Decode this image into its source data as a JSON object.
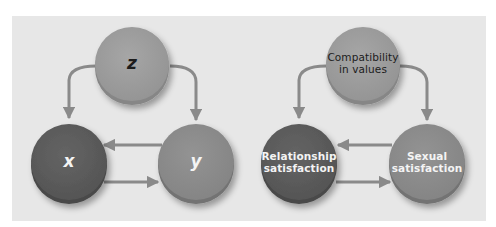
{
  "colors": {
    "background": "#ffffff",
    "panel": "#e7e7e7",
    "top_node": "#9d9d9d",
    "top_node_rim": "#868686",
    "left_node": "#5c5c5c",
    "left_node_rim": "#494949",
    "right_node": "#8c8c8c",
    "right_node_rim": "#737373",
    "arrow": "#8a8a8a",
    "dark_text": "#1c1c1c",
    "light_text": "#f4f4f4"
  },
  "diagrams": [
    {
      "id": "abstract",
      "nodes": {
        "top": {
          "label": "z"
        },
        "left": {
          "label": "x"
        },
        "right": {
          "label": "y"
        }
      },
      "edges": [
        {
          "from": "z",
          "to": "x"
        },
        {
          "from": "z",
          "to": "y"
        },
        {
          "from": "y",
          "to": "x"
        },
        {
          "from": "x",
          "to": "y"
        }
      ]
    },
    {
      "id": "example",
      "nodes": {
        "top": {
          "label_line1": "Compatibility",
          "label_line2": "in values"
        },
        "left": {
          "label_line1": "Relationship",
          "label_line2": "satisfaction"
        },
        "right": {
          "label_line1": "Sexual",
          "label_line2": "satisfaction"
        }
      },
      "edges": [
        {
          "from": "Compatibility in values",
          "to": "Relationship satisfaction"
        },
        {
          "from": "Compatibility in values",
          "to": "Sexual satisfaction"
        },
        {
          "from": "Sexual satisfaction",
          "to": "Relationship satisfaction"
        },
        {
          "from": "Relationship satisfaction",
          "to": "Sexual satisfaction"
        }
      ]
    }
  ]
}
